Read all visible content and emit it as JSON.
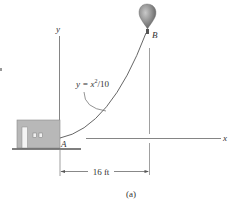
{
  "figure": {
    "caption": "(a)",
    "equation": {
      "lhs": "y = x",
      "exponent": "2",
      "rhs": "/10"
    },
    "axis_labels": {
      "x": "x",
      "y": "y"
    },
    "points": {
      "start": "A",
      "end": "B"
    },
    "dimension": {
      "label": "16 ft"
    },
    "colors": {
      "line": "#555555",
      "axis": "#666666",
      "house": "#b5b5b5",
      "house_edge": "#8a8a8a",
      "balloon": "#8e8e8e",
      "ground": "#555555"
    }
  }
}
